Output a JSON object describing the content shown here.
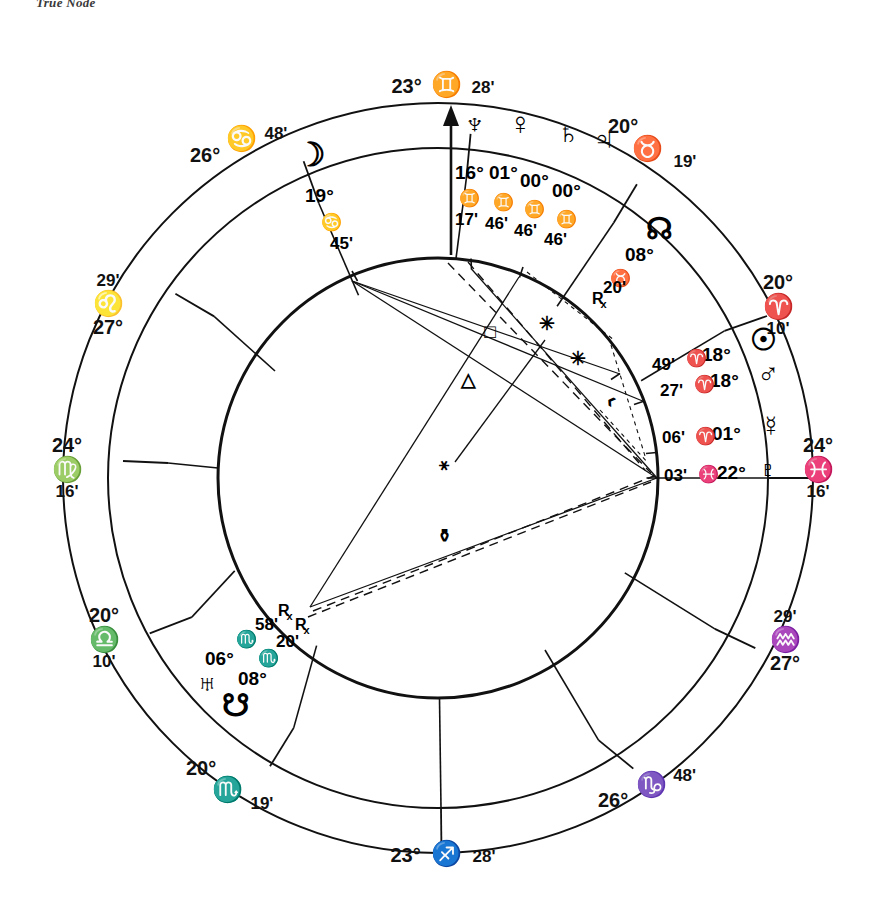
{
  "header": {
    "note": "True Node"
  },
  "chart": {
    "kind": "natal-wheel",
    "geometry": {
      "cx": 438,
      "cy": 478,
      "r_outer": 375,
      "r_inner": 330,
      "r_circle": 220,
      "asc_angle_deg": 180
    },
    "cusps": [
      {
        "name": "cusp-asc",
        "deg": "24°",
        "sign": "♓",
        "sign_name": "Pisces",
        "min": "16'",
        "x": 818,
        "y": 468,
        "arrow": false
      },
      {
        "name": "cusp-2",
        "deg": "20°",
        "sign": "♈",
        "sign_name": "Aries",
        "min": "10'",
        "x": 773,
        "y": 300,
        "arrow": false
      },
      {
        "name": "cusp-3",
        "deg": "20°",
        "sign": "♉",
        "sign_name": "Taurus",
        "min": "19'",
        "x": 650,
        "y": 140,
        "arrow": false
      },
      {
        "name": "cusp-mc",
        "deg": "23°",
        "sign": "♊",
        "sign_name": "Gemini",
        "min": "28'",
        "x": 438,
        "y": 85,
        "arrow": true
      },
      {
        "name": "cusp-5",
        "deg": "26°",
        "sign": "♋",
        "sign_name": "Cancer",
        "min": "48'",
        "x": 228,
        "y": 143,
        "arrow": false
      },
      {
        "name": "cusp-6",
        "deg": "27°",
        "sign": "♌",
        "sign_name": "Leo",
        "min": "29'",
        "x": 101,
        "y": 300,
        "arrow": false
      },
      {
        "name": "cusp-dsc",
        "deg": "24°",
        "sign": "♍",
        "sign_name": "Virgo",
        "min": "16'",
        "x": 60,
        "y": 468,
        "arrow": false
      },
      {
        "name": "cusp-8",
        "deg": "20°",
        "sign": "♎",
        "sign_name": "Libra",
        "min": "10'",
        "x": 102,
        "y": 638,
        "arrow": false
      },
      {
        "name": "cusp-9",
        "deg": "20°",
        "sign": "♏",
        "sign_name": "Scorpio",
        "min": "19'",
        "x": 226,
        "y": 792,
        "arrow": false
      },
      {
        "name": "cusp-ic",
        "deg": "23°",
        "sign": "♐",
        "sign_name": "Sagittarius",
        "min": "28'",
        "x": 438,
        "y": 854,
        "arrow": false
      },
      {
        "name": "cusp-11",
        "deg": "26°",
        "sign": "♑",
        "sign_name": "Capricorn",
        "min": "48'",
        "x": 650,
        "y": 794,
        "arrow": false
      },
      {
        "name": "cusp-12",
        "deg": "27°",
        "sign": "♒",
        "sign_name": "Aquarius",
        "min": "29'",
        "x": 778,
        "y": 640,
        "arrow": false
      }
    ],
    "planets": [
      {
        "name": "neptune",
        "glyph": "♆",
        "label": "Neptune",
        "deg": "16°",
        "sign": "♊",
        "min": "17'",
        "retro": ""
      },
      {
        "name": "venus",
        "glyph": "♀",
        "label": "Venus",
        "deg": "01°",
        "sign": "♊",
        "min": "46'",
        "retro": ""
      },
      {
        "name": "saturn",
        "glyph": "♄",
        "label": "Saturn",
        "deg": "00°",
        "sign": "♊",
        "min": "46'",
        "retro": ""
      },
      {
        "name": "jupiter",
        "glyph": "♃",
        "label": "Jupiter",
        "deg": "00°",
        "sign": "♊",
        "min": "46'",
        "retro": ""
      },
      {
        "name": "moon",
        "glyph": "☽",
        "label": "Moon",
        "deg": "19°",
        "sign": "♋",
        "min": "45'",
        "retro": ""
      },
      {
        "name": "north-node",
        "glyph": "☊",
        "label": "North Node",
        "deg": "08°",
        "sign": "♉",
        "min": "20'",
        "retro": "R"
      },
      {
        "name": "sun",
        "glyph": "☉",
        "label": "Sun",
        "deg": "18°",
        "sign": "♈",
        "min": "49'",
        "retro": ""
      },
      {
        "name": "mars",
        "glyph": "♂",
        "label": "Mars",
        "deg": "18°",
        "sign": "♈",
        "min": "27'",
        "retro": ""
      },
      {
        "name": "mercury",
        "glyph": "☿",
        "label": "Mercury",
        "deg": "01°",
        "sign": "♈",
        "min": "06'",
        "retro": ""
      },
      {
        "name": "pluto",
        "glyph": "♇",
        "label": "Pluto",
        "deg": "22°",
        "sign": "♓",
        "min": "03'",
        "retro": ""
      },
      {
        "name": "uranus",
        "glyph": "♅",
        "label": "Uranus",
        "deg": "06°",
        "sign": "♏",
        "min": "58'",
        "retro": "R"
      },
      {
        "name": "south-node",
        "glyph": "☋",
        "label": "South Node",
        "deg": "08°",
        "sign": "♏",
        "min": "20'",
        "retro": "R"
      }
    ],
    "aspects": [
      {
        "name": "aspect-square",
        "glyph": "□",
        "label": "Square"
      },
      {
        "name": "aspect-trine",
        "glyph": "△",
        "label": "Trine"
      },
      {
        "name": "aspect-conjunction",
        "glyph": "⚹",
        "label": "Sextile"
      },
      {
        "name": "aspect-opposition",
        "glyph": "⚱",
        "label": "Opposition"
      },
      {
        "name": "aspect-sextile-a",
        "glyph": "✳",
        "label": "Sextile"
      },
      {
        "name": "aspect-sextile-b",
        "glyph": "✳",
        "label": "Sextile"
      },
      {
        "name": "aspect-semisextile",
        "glyph": "‹",
        "label": "Semisextile"
      }
    ],
    "planet_labels": {
      "neptune_pos": {
        "deg": "16°",
        "sign": "♊",
        "min": "17'"
      },
      "venus_pos": {
        "deg": "01°",
        "sign": "♊",
        "min": "46'"
      },
      "saturn_pos": {
        "deg": "00°",
        "sign": "♊",
        "min": "46'"
      },
      "jupiter_pos": {
        "deg": "00°",
        "sign": "♊",
        "min": "46'"
      },
      "moon_pos": {
        "deg": "19°",
        "sign": "♋",
        "min": "45'"
      },
      "node_pos": {
        "deg": "08°",
        "sign": "♉",
        "min": "20'",
        "retro": "R"
      },
      "sun_pos": {
        "deg": "18°",
        "sign": "♈",
        "min": "49'"
      },
      "mars_pos": {
        "deg": "18°",
        "sign": "♈",
        "min": "27'"
      },
      "mercury_pos": {
        "deg": "01°",
        "sign": "♈",
        "min": "06'"
      },
      "pluto_pos": {
        "deg": "22°",
        "sign": "♓",
        "min": "03'"
      },
      "uranus_pos": {
        "deg": "06°",
        "sign": "♏",
        "min": "58'",
        "retro": "R"
      },
      "snode_pos": {
        "deg": "08°",
        "sign": "♏",
        "min": "20'",
        "retro": "R"
      }
    },
    "colors": {
      "ink": "#111111",
      "paper": "#ffffff"
    }
  }
}
